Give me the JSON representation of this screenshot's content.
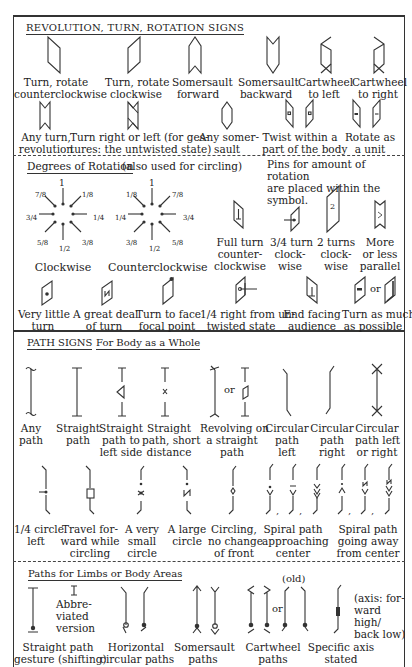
{
  "revolution": {
    "heading": "REVOLUTION, TURN, ROTATION SIGNS",
    "row1": [
      {
        "icon": "turn-ccw-icon",
        "label": [
          "Turn, rotate",
          "counterclockwise"
        ]
      },
      {
        "icon": "turn-cw-icon",
        "label": [
          "Turn, rotate",
          "clockwise"
        ]
      },
      {
        "icon": "somersault-forward-icon",
        "label": [
          "Somersault",
          "forward"
        ]
      },
      {
        "icon": "somersault-backward-icon",
        "label": [
          "Somersault",
          "backward"
        ]
      },
      {
        "icon": "cartwheel-left-icon",
        "label": [
          "Cartwheel",
          "to left"
        ]
      },
      {
        "icon": "cartwheel-right-icon",
        "label": [
          "Cartwheel",
          "to right"
        ]
      }
    ],
    "row2": [
      {
        "icon": "any-turn-icon",
        "label": [
          "Any turn,",
          "revolution"
        ]
      },
      {
        "icon": "turn-right-or-left-icon",
        "label": [
          "Turn right or left (for ges-",
          "tures: the untwisted state)"
        ]
      },
      {
        "icon": "any-somersault-icon",
        "label": [
          "Any somer-",
          "sault"
        ]
      },
      {
        "icon": "twist-within-part-icon",
        "label": [
          "Twist within a",
          "part of the body"
        ]
      },
      {
        "icon": "rotate-as-unit-icon",
        "label": [
          "Rotate as",
          "a unit"
        ]
      }
    ]
  },
  "degrees": {
    "heading": "Degrees of Rotation",
    "heading_note": "(also used for circling)",
    "pins_note": [
      "Pins for amount of rotation",
      "are placed within the symbol."
    ],
    "clockwise": {
      "label": "Clockwise",
      "top": "1",
      "bottom": "1/2",
      "left": "3/4",
      "right": "1/4",
      "tl": "7/8",
      "tr": "1/8",
      "bl": "5/8",
      "br": "3/8"
    },
    "counterclockwise": {
      "label": "Counterclockwise",
      "top": "1",
      "bottom": "1/2",
      "left": "1/4",
      "right": "3/4",
      "tl": "1/8",
      "tr": "7/8",
      "bl": "3/8",
      "br": "5/8"
    },
    "pins": [
      {
        "icon": "full-turn-ccw-icon",
        "label": [
          "Full turn",
          "counter-",
          "clockwise"
        ]
      },
      {
        "icon": "three-quarter-turn-cw-icon",
        "label": [
          "3/4 turn",
          "clock-",
          "wise"
        ]
      },
      {
        "icon": "two-turns-cw-icon",
        "label": [
          "2 turns",
          "clock-",
          "wise"
        ],
        "digit": "2"
      },
      {
        "icon": "more-or-less-parallel-icon",
        "label": [
          "More",
          "or less",
          "parallel"
        ]
      }
    ],
    "row3": [
      {
        "icon": "very-little-turn-icon",
        "label": [
          "Very little",
          "turn"
        ]
      },
      {
        "icon": "great-deal-turn-icon",
        "label": [
          "A great deal",
          "of turn"
        ]
      },
      {
        "icon": "turn-to-focal-point-icon",
        "label": [
          "Turn to face",
          "focal point"
        ]
      },
      {
        "icon": "quarter-right-icon",
        "label": [
          "1/4 right from un-",
          "twisted state"
        ]
      },
      {
        "icon": "end-facing-audience-icon",
        "label": [
          "End facing",
          "audience"
        ]
      },
      {
        "icon": "turn-as-much-icon",
        "label": [
          "Turn as much",
          "as possible"
        ],
        "or": "or"
      }
    ]
  },
  "path": {
    "heading": "PATH SIGNS",
    "subheading": "For Body as a Whole",
    "row1": [
      {
        "icon": "any-path-icon",
        "label": [
          "Any",
          "path"
        ]
      },
      {
        "icon": "straight-path-icon",
        "label": [
          "Straight",
          "path"
        ]
      },
      {
        "icon": "straight-path-left-icon",
        "label": [
          "Straight",
          "path to",
          "left side"
        ]
      },
      {
        "icon": "straight-path-short-icon",
        "label": [
          "Straight",
          "path, short",
          "distance"
        ]
      },
      {
        "icon": "revolving-straight-path-icon",
        "label": [
          "Revolving on",
          "a straight",
          "path"
        ],
        "or": "or"
      },
      {
        "icon": "circular-path-left-icon",
        "label": [
          "Circular",
          "path",
          "left"
        ]
      },
      {
        "icon": "circular-path-right-icon",
        "label": [
          "Circular",
          "path",
          "right"
        ]
      },
      {
        "icon": "circular-path-either-icon",
        "label": [
          "Circular",
          "path left",
          "or right"
        ]
      }
    ],
    "row2": [
      {
        "icon": "quarter-circle-left-icon",
        "label": [
          "1/4 circle",
          "left"
        ]
      },
      {
        "icon": "travel-forward-circling-icon",
        "label": [
          "Travel for-",
          "ward while",
          "circling"
        ]
      },
      {
        "icon": "very-small-circle-icon",
        "label": [
          "A very",
          "small",
          "circle"
        ]
      },
      {
        "icon": "large-circle-icon",
        "label": [
          "A large",
          "circle"
        ]
      },
      {
        "icon": "circling-no-change-icon",
        "label": [
          "Circling,",
          "no change",
          "of front"
        ]
      },
      {
        "icon": "spiral-approaching-icon",
        "label": [
          "Spiral path",
          "approaching",
          "center"
        ]
      },
      {
        "icon": "spiral-away-icon",
        "label": [
          "Spiral path",
          "going away",
          "from center"
        ]
      }
    ]
  },
  "limbs": {
    "heading": "Paths for Limbs or Body Areas",
    "abbrev_label": [
      "Abbre-",
      "viated",
      "version"
    ],
    "old_label": "(old)",
    "or_label": "or",
    "axis_note": [
      "(axis: for-",
      "ward high/",
      "back low)"
    ],
    "items": [
      {
        "icon": "straight-path-gesture-icon",
        "label": [
          "Straight path",
          "gesture (shifting)"
        ]
      },
      {
        "icon": "horizontal-circular-icon",
        "label": [
          "Horizontal",
          "circular paths"
        ]
      },
      {
        "icon": "somersault-paths-icon",
        "label": [
          "Somersault",
          "paths"
        ]
      },
      {
        "icon": "cartwheel-paths-icon",
        "label": [
          "Cartwheel",
          "paths"
        ]
      },
      {
        "icon": "specific-axis-icon",
        "label": [
          "Specific axis",
          "stated"
        ]
      }
    ]
  }
}
